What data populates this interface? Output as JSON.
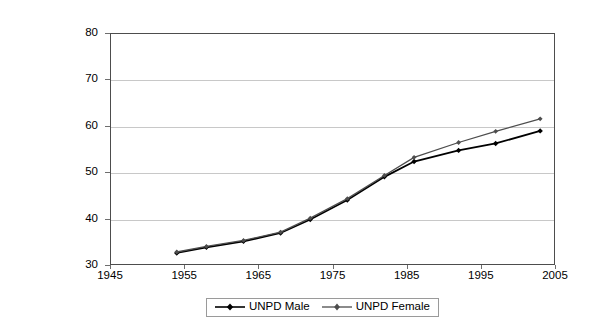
{
  "chart_data": {
    "type": "line",
    "title": "",
    "subtitle": "",
    "xlabel": "",
    "ylabel": "",
    "xlim": [
      1945,
      2005
    ],
    "ylim": [
      30,
      80
    ],
    "xticks": [
      1945,
      1955,
      1965,
      1975,
      1985,
      1995,
      2005
    ],
    "yticks": [
      30,
      40,
      50,
      60,
      70,
      80
    ],
    "xtick_labels": [
      "1945",
      "1955",
      "1965",
      "1975",
      "1985",
      "1995",
      "2005"
    ],
    "ytick_labels": [
      "30",
      "40",
      "50",
      "60",
      "70",
      "80"
    ],
    "grid": "horizontal",
    "legend_position": "bottom-center",
    "x": [
      1954,
      1958,
      1963,
      1968,
      1972,
      1977,
      1982,
      1986,
      1992,
      1997,
      2003
    ],
    "series": [
      {
        "name": "UNPD Male",
        "color": "#000000",
        "marker": "diamond",
        "values": [
          32.6,
          33.8,
          35.1,
          36.9,
          39.8,
          44.0,
          49.0,
          52.3,
          54.7,
          56.2,
          58.9
        ]
      },
      {
        "name": "UNPD Female",
        "color": "#4d4d4d",
        "marker": "diamond",
        "values": [
          32.8,
          34.0,
          35.3,
          37.1,
          40.1,
          44.3,
          49.3,
          53.2,
          56.4,
          58.8,
          61.5
        ]
      }
    ]
  },
  "legend": {
    "entries": [
      {
        "label": "UNPD Male"
      },
      {
        "label": "UNPD Female"
      }
    ]
  },
  "axes": {
    "y_axis_name": "value-axis",
    "x_axis_name": "year-axis"
  }
}
